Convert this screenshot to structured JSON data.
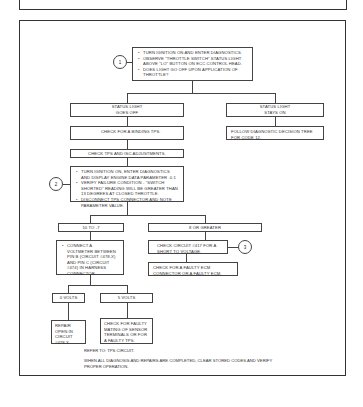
{
  "flowchart": {
    "start": {
      "marker": "1",
      "bullets": [
        "TURN IGNITION ON AND ENTER DIAGNOSTICS.",
        "OBSERVE \"THROTTLE SWITCH\" STATUS LIGHT ABOVE \"LO\" BUTTON ON ECC CONTROL HEAD.",
        "DOES LIGHT GO OFF UPON APPLICATION OF THROTTLE?"
      ]
    },
    "branch_off": {
      "line1": "STATUS LIGHT",
      "line2": "GOES OFF"
    },
    "branch_on": {
      "line1": "STATUS LIGHT",
      "line2": "STAYS ON"
    },
    "check_binding": "CHECK FOR A BINDING TPS.",
    "follow_tree": "FOLLOW DIAGNOSTIC DECISION TREE FOR CODE 12.",
    "check_tps_isc": "CHECK TPS AND ISC ADJUSTMENTS.",
    "step2": {
      "marker": "2",
      "bullets": [
        "TURN IGNITION ON, ENTER DIAGNOSTICS AND DISPLAY ENGINE DATA PARAMETER .0.1",
        "VERIFY FAILURE CONDITION - \"SWITCH SHORTED\" READING WILL BE GREATER THAN 13 DEGREES AT CLOSED THROTTLE.",
        "DISCONNECT TPS CONNECTOR AND NOTE PARAMETER VALUE."
      ]
    },
    "range_low": "10 TO -7",
    "range_high": "8 OR GREATER",
    "connect_voltmeter": {
      "bullets": [
        "CONNECT A VOLTMETER BETWEEN PIN B (CIRCUIT #478.X) AND PIN C (CIRCUIT #474) IN HARNESS CONNECTOR."
      ]
    },
    "check_circuit": "CHECK CIRCUIT #417 FOR A SHORT TO VOLTAGE.",
    "step3_marker": "3",
    "check_ecm": "CHECK FOR A FAULTY ECM CONNECTOR OR A FAULTY ECM.",
    "zero_volts": "0 VOLTS",
    "five_volts": "5 VOLTS",
    "repair_open": "REPAIR OPEN IN CIRCUIT #478.X.",
    "check_mating": "CHECK FOR FAULTY MATING OF SENSOR TERMINALS OR FOR A FAULTY TPS.",
    "refer_to": "REFER TO: TPS CIRCUIT.",
    "final_note": "WHEN ALL DIAGNOSIS AND REPAIRS ARE COMPLETED, CLEAR STORED CODES AND VERIFY PROPER OPERATION."
  }
}
